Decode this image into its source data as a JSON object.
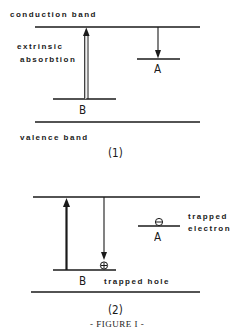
{
  "figure": {
    "caption": "- FIGURE I -",
    "line_color": "#1a1a1a",
    "panels": [
      {
        "id": "1",
        "label": "(1)",
        "conduction_band_label": "conduction  band",
        "valence_band_label": "valence   band",
        "transition_label_line1": "extrinsic",
        "transition_label_line2": "absorbtion",
        "level_a_label": "A",
        "level_b_label": "B",
        "arrows": [
          {
            "name": "extrinsic-absorption-arrow",
            "from": "B",
            "to": "conduction band",
            "direction": "up",
            "style": "double-line"
          },
          {
            "name": "electron-capture-arrow",
            "from": "conduction band",
            "to": "A",
            "direction": "down",
            "style": "single-line"
          }
        ]
      },
      {
        "id": "2",
        "label": "(2)",
        "level_a_label": "A",
        "level_b_label": "B",
        "trapped_electron_line1": "trapped",
        "trapped_electron_line2": "electron",
        "trapped_hole_label": "trapped  hole",
        "electron_symbol": "⊖",
        "hole_symbol": "⊕",
        "arrows": [
          {
            "name": "excitation-arrow",
            "from": "B",
            "to": "conduction band",
            "direction": "up",
            "style": "bold"
          },
          {
            "name": "recombination-arrow",
            "from": "conduction band",
            "to": "B",
            "direction": "down",
            "style": "single-line"
          }
        ]
      }
    ]
  }
}
